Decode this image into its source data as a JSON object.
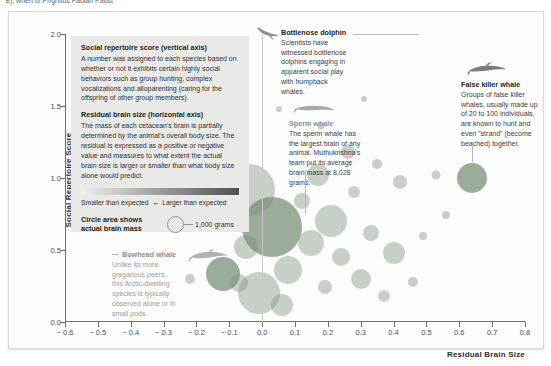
{
  "top_caption": "e), when of Prignitus Fabian Pabst",
  "axes": {
    "x": {
      "title": "Residual Brain Size",
      "ticks": [
        "− 0.6",
        "− 0.5",
        "− 0.4",
        "− 0.3",
        "− 0.2",
        "− 0.1",
        "0.0",
        "0.1",
        "0.2",
        "0.3",
        "0.4",
        "0.5",
        "0.6",
        "0.7",
        "0.8"
      ],
      "min": -0.6,
      "max": 0.8,
      "step": 0.1
    },
    "y": {
      "title": "Social Repertoire Score",
      "ticks": [
        "2.0",
        "1.5",
        "1.0",
        "0.5",
        "0.0"
      ],
      "min": 0.0,
      "max": 2.0,
      "step": 0.5
    }
  },
  "legend": {
    "h1": "Social repertoire score (vertical axis)",
    "p1": "A number was assigned to each species based on whether or not it exhibits certain highly social behaviors such as group hunting, complex vocalizations and alloparenting (caring for the offspring of other group members).",
    "h2": "Residual brain size (horizontal axis)",
    "p2": "The mass of each cetacean's brain is partially determined by the animal's overall body size. The residual is expressed as a positive or negative value and measures to what extent the actual brain size is larger or smaller than what body size alone would predict.",
    "gradient_left": "Smaller than expected",
    "gradient_arrow": "↔",
    "gradient_right": "Larger than expected",
    "circle_key_label": "Circle area shows actual brain mass",
    "circle_key_value": "1,000 grams",
    "bg_color": "#e9e9e7"
  },
  "annotations": [
    {
      "name": "bottlenose-dolphin",
      "title": "Bottlenose dolphin",
      "body": "Scientists have witnessed bottlenose dolphins engaging in apparent social play with humpback whales.",
      "icon": "dolphin-silhouette"
    },
    {
      "name": "false-killer-whale",
      "title": "False killer whale",
      "body": "Groups of false killer whales, usually made up of 20 to 100 individuals, are known to hunt and even \"strand\" (become beached) together.",
      "icon": "false-killer-whale-silhouette"
    },
    {
      "name": "sperm-whale",
      "title": "Sperm whale",
      "body": "The sperm whale has the largest brain of any animal. Muthukrishna's team put its average brain mass at 8,028 grams.",
      "icon": "sperm-whale-silhouette"
    },
    {
      "name": "bowhead-whale",
      "title": "Bowhead whale",
      "body": "Unlike its more gregarious peers, this Arctic-dwelling species is typically observed alone or in small pods.",
      "icon": "bowhead-whale-silhouette"
    }
  ],
  "chart_data": {
    "type": "scatter",
    "title": "",
    "xlabel": "Residual Brain Size",
    "ylabel": "Social Repertoire Score",
    "xlim": [
      -0.6,
      0.8
    ],
    "ylim": [
      0.0,
      2.0
    ],
    "grid": false,
    "legend_position": "inside-top-left",
    "size_encoding": "Circle area shows actual brain mass; reference circle = 1,000 grams",
    "color": "#7c927a",
    "points": [
      {
        "x": -0.22,
        "y": 0.3,
        "r": 5.0
      },
      {
        "x": -0.16,
        "y": 0.78,
        "r": 3.0
      },
      {
        "x": -0.12,
        "y": 0.33,
        "r": 17.0,
        "label": "Bowhead whale"
      },
      {
        "x": -0.07,
        "y": 0.27,
        "r": 9.0
      },
      {
        "x": -0.05,
        "y": 0.52,
        "r": 12.0
      },
      {
        "x": -0.04,
        "y": 0.92,
        "r": 26.0
      },
      {
        "x": -0.01,
        "y": 0.2,
        "r": 21.0
      },
      {
        "x": 0.03,
        "y": 0.66,
        "r": 30.0,
        "label": "Sperm whale"
      },
      {
        "x": 0.06,
        "y": 0.12,
        "r": 11.0
      },
      {
        "x": 0.08,
        "y": 0.36,
        "r": 14.0
      },
      {
        "x": 0.12,
        "y": 0.84,
        "r": 8.0
      },
      {
        "x": 0.15,
        "y": 0.55,
        "r": 13.0
      },
      {
        "x": 0.17,
        "y": 1.02,
        "r": 11.0
      },
      {
        "x": 0.19,
        "y": 0.24,
        "r": 7.0
      },
      {
        "x": 0.21,
        "y": 0.7,
        "r": 16.0
      },
      {
        "x": 0.24,
        "y": 0.45,
        "r": 9.0
      },
      {
        "x": 0.26,
        "y": 1.18,
        "r": 7.0
      },
      {
        "x": 0.28,
        "y": 0.9,
        "r": 6.0
      },
      {
        "x": 0.3,
        "y": 0.3,
        "r": 10.0
      },
      {
        "x": 0.33,
        "y": 0.62,
        "r": 8.0
      },
      {
        "x": 0.35,
        "y": 1.1,
        "r": 5.0
      },
      {
        "x": 0.37,
        "y": 0.18,
        "r": 6.0
      },
      {
        "x": 0.4,
        "y": 0.48,
        "r": 11.0
      },
      {
        "x": 0.42,
        "y": 0.97,
        "r": 7.0
      },
      {
        "x": 0.46,
        "y": 0.28,
        "r": 5.0
      },
      {
        "x": 0.49,
        "y": 0.6,
        "r": 4.0
      },
      {
        "x": 0.53,
        "y": 1.02,
        "r": 4.5
      },
      {
        "x": 0.56,
        "y": 0.74,
        "r": 4.0
      },
      {
        "x": 0.64,
        "y": 1.0,
        "r": 15.0,
        "label": "False killer whale"
      },
      {
        "x": 0.05,
        "y": 1.48,
        "r": 3.0
      },
      {
        "x": 0.18,
        "y": 1.36,
        "r": 3.5
      },
      {
        "x": 0.31,
        "y": 1.55,
        "r": 3.0
      }
    ]
  }
}
